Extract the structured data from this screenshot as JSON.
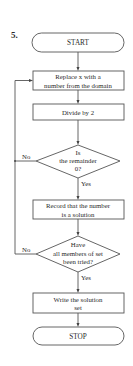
{
  "problem_number": "5.",
  "nodes": {
    "start": {
      "label": "START",
      "type": "terminal"
    },
    "replace": {
      "line1": "Replace x with a",
      "line2": "number from the domain",
      "type": "process"
    },
    "divide": {
      "label": "Divide by 2",
      "type": "process"
    },
    "decision1": {
      "line1": "Is",
      "line2": "the remainder",
      "line3": "0?",
      "type": "decision",
      "no_label": "No",
      "yes_label": "Yes"
    },
    "record": {
      "line1": "Record that the number",
      "line2": "is a solution",
      "type": "process"
    },
    "decision2": {
      "line1": "Have",
      "line2": "all members of set",
      "line3": "been tried?",
      "type": "decision",
      "no_label": "No",
      "yes_label": "Yes"
    },
    "write": {
      "line1": "Write the solution",
      "line2": "set",
      "type": "process"
    },
    "stop": {
      "label": "STOP",
      "type": "terminal"
    }
  },
  "colors": {
    "stroke": "#555555",
    "text": "#2a2a2a",
    "background": "#ffffff"
  }
}
